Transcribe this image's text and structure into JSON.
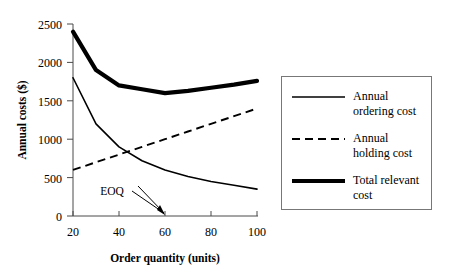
{
  "chart_data": {
    "type": "line",
    "title": "",
    "xlabel": "Order quantity (units)",
    "ylabel": "Annual costs ($)",
    "xlim": [
      20,
      100
    ],
    "ylim": [
      0,
      2500
    ],
    "xticks": [
      20,
      40,
      60,
      80,
      100
    ],
    "yticks": [
      0,
      500,
      1000,
      1500,
      2000,
      2500
    ],
    "xtick_labels": [
      "20",
      "40",
      "60",
      "80",
      "100"
    ],
    "ytick_labels": [
      "0",
      "500",
      "1000",
      "1500",
      "2000",
      "2500"
    ],
    "grid": false,
    "legend_position": "right",
    "x": [
      20,
      30,
      40,
      50,
      60,
      70,
      80,
      90,
      100
    ],
    "series": [
      {
        "name": "Annual ordering cost",
        "style": "solid-thin",
        "values": [
          1800,
          1200,
          900,
          720,
          600,
          515,
          450,
          400,
          350
        ]
      },
      {
        "name": "Annual holding cost",
        "style": "dashed",
        "values": [
          600,
          700,
          800,
          900,
          1000,
          1100,
          1200,
          1300,
          1400
        ]
      },
      {
        "name": "Total relevant cost",
        "style": "solid-thick",
        "values": [
          2400,
          1900,
          1700,
          1650,
          1600,
          1630,
          1670,
          1710,
          1760
        ]
      }
    ],
    "annotations": [
      {
        "text": "EOQ",
        "x": 60,
        "y": 0,
        "label_x": 50,
        "label_y": 260,
        "type": "arrow-annotation"
      }
    ]
  },
  "legend": {
    "items": [
      {
        "label_line1": "Annual",
        "label_line2": "ordering cost",
        "sample": "solid-thin"
      },
      {
        "label_line1": "Annual",
        "label_line2": "holding cost",
        "sample": "dashed"
      },
      {
        "label_line1": "Total relevant",
        "label_line2": "cost",
        "sample": "solid-thick"
      }
    ]
  }
}
